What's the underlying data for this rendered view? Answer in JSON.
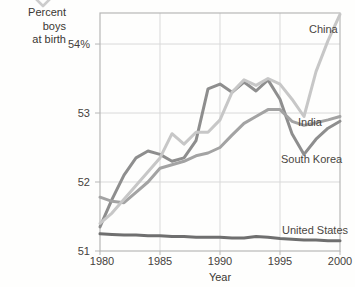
{
  "header": {
    "title_line1": "Percent boys",
    "title_line2": "at birth"
  },
  "colors": {
    "china_line": "#c7c7c7",
    "india_line": "#a3a3a3",
    "south_korea_line": "#8e8e8e",
    "united_states_line": "#6f6f6f",
    "gridline": "#d9d9d9",
    "plot_border": "#b7b7b7",
    "text": "#45413c",
    "watermark": "#cccccc"
  },
  "chart_data": {
    "type": "line",
    "title": "Percent boys at birth",
    "xlabel": "Year",
    "ylabel": "Percent boys at birth",
    "grid": true,
    "legend_position": "inline-labels-right",
    "x_range": [
      1980,
      2000
    ],
    "y_range": [
      51,
      54.45
    ],
    "x_ticks": [
      1980,
      1985,
      1990,
      1995,
      2000
    ],
    "x_tick_labels": [
      "1980",
      "1985",
      "1990",
      "1995",
      "2000"
    ],
    "y_ticks": [
      54,
      53,
      52,
      51
    ],
    "y_tick_labels": [
      "54%",
      "53",
      "52",
      "51"
    ],
    "x": [
      1980,
      1981,
      1982,
      1983,
      1984,
      1985,
      1986,
      1987,
      1988,
      1989,
      1990,
      1991,
      1992,
      1993,
      1994,
      1995,
      1996,
      1997,
      1998,
      1999,
      2000
    ],
    "series": [
      {
        "name": "China",
        "color": "#c7c7c7",
        "values": [
          51.4,
          51.55,
          51.75,
          51.95,
          52.15,
          52.35,
          52.7,
          52.55,
          52.72,
          52.72,
          52.9,
          53.3,
          53.48,
          53.4,
          53.5,
          53.42,
          53.2,
          52.95,
          53.6,
          54.05,
          54.43
        ]
      },
      {
        "name": "India",
        "color": "#a3a3a3",
        "values": [
          51.78,
          51.72,
          51.7,
          51.85,
          52.0,
          52.2,
          52.25,
          52.3,
          52.38,
          52.42,
          52.5,
          52.68,
          52.85,
          52.95,
          53.05,
          53.05,
          52.88,
          52.82,
          52.86,
          52.9,
          52.95
        ]
      },
      {
        "name": "South Korea",
        "color": "#8e8e8e",
        "values": [
          51.35,
          51.75,
          52.1,
          52.35,
          52.45,
          52.4,
          52.3,
          52.35,
          52.6,
          53.35,
          53.42,
          53.3,
          53.45,
          53.32,
          53.48,
          53.2,
          52.7,
          52.4,
          52.62,
          52.78,
          52.88
        ]
      },
      {
        "name": "United States",
        "color": "#6f6f6f",
        "values": [
          51.25,
          51.24,
          51.23,
          51.23,
          51.22,
          51.22,
          51.21,
          51.21,
          51.2,
          51.2,
          51.2,
          51.19,
          51.19,
          51.21,
          51.2,
          51.18,
          51.17,
          51.16,
          51.16,
          51.15,
          51.15
        ]
      }
    ]
  }
}
